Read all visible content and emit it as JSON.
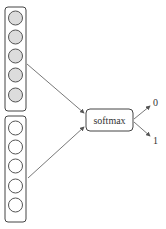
{
  "diagram": {
    "input_groups": [
      {
        "name": "input-group-top",
        "units": 5,
        "filled": true,
        "fill": "#dcdcdc"
      },
      {
        "name": "input-group-bottom",
        "units": 5,
        "filled": false,
        "fill": "#ffffff"
      }
    ],
    "node": {
      "label": "softmax"
    },
    "outputs": [
      "0",
      "1"
    ],
    "colors": {
      "stroke": "#444444",
      "arrow": "#555555",
      "filled_unit": "#dcdcdc"
    }
  }
}
